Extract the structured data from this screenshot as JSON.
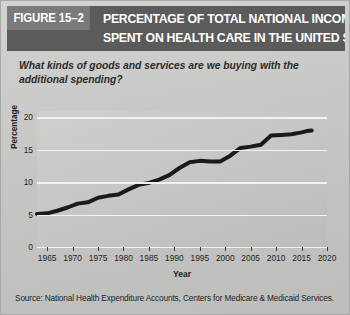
{
  "header": {
    "figure_number": "FIGURE 15–2",
    "title_line_1": "PERCENTAGE OF TOTAL NATIONAL INCOME",
    "title_line_2": "SPENT ON HEALTH CARE IN THE UNITED STATES",
    "banner_color": "#5b5b5b",
    "figure_box_color": "#7a7a7a"
  },
  "subtitle": "What kinds of goods and services are we buying with the additional spending?",
  "source": "Source: National Health Expenditure Accounts, Centers for Medicare & Medicaid Services.",
  "chart_data": {
    "type": "line",
    "title": "PERCENTAGE OF TOTAL NATIONAL INCOME SPENT ON HEALTH CARE IN THE UNITED STATES",
    "xlabel": "Year",
    "ylabel": "Percentage",
    "xlim": [
      1963,
      2020
    ],
    "ylim": [
      0,
      21
    ],
    "xticks": [
      1965,
      1970,
      1975,
      1980,
      1985,
      1990,
      1995,
      2000,
      2005,
      2010,
      2015,
      2020
    ],
    "yticks": [
      0,
      5,
      10,
      15,
      20
    ],
    "grid": "horizontal",
    "legend": "none",
    "line_color": "#1a1a1a",
    "line_width": 4,
    "series": [
      {
        "name": "Health care share of national income",
        "x": [
          1963,
          1965,
          1967,
          1969,
          1971,
          1973,
          1975,
          1977,
          1979,
          1981,
          1983,
          1985,
          1987,
          1989,
          1991,
          1993,
          1995,
          1997,
          1999,
          2001,
          2003,
          2005,
          2007,
          2009,
          2011,
          2013,
          2015,
          2016,
          2017
        ],
        "values": [
          5.1,
          5.2,
          5.6,
          6.1,
          6.7,
          6.9,
          7.6,
          7.9,
          8.1,
          8.9,
          9.6,
          9.9,
          10.4,
          11.1,
          12.2,
          13.1,
          13.3,
          13.2,
          13.2,
          14.1,
          15.3,
          15.5,
          15.8,
          17.2,
          17.3,
          17.4,
          17.7,
          17.9,
          18.0
        ]
      }
    ]
  }
}
